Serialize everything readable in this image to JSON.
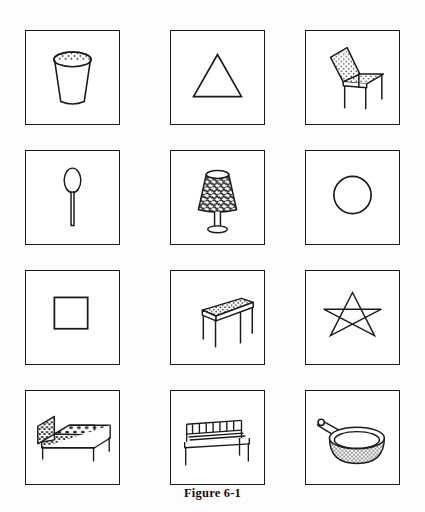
{
  "figure": {
    "caption": "Figure 6-1",
    "columns": 3,
    "rows": 4
  },
  "grid": {
    "cells": [
      {
        "index": 1,
        "row": 1,
        "column": 1,
        "name": "cup",
        "label": "cup",
        "category": "object",
        "icon": "cup-drawing"
      },
      {
        "index": 2,
        "row": 1,
        "column": 2,
        "name": "triangle",
        "label": "triangle",
        "category": "shape",
        "icon": "triangle-shape"
      },
      {
        "index": 3,
        "row": 1,
        "column": 3,
        "name": "chair",
        "label": "chair",
        "category": "object",
        "icon": "chair-drawing"
      },
      {
        "index": 4,
        "row": 2,
        "column": 1,
        "name": "spoon",
        "label": "spoon",
        "category": "object",
        "icon": "spoon-drawing"
      },
      {
        "index": 5,
        "row": 2,
        "column": 2,
        "name": "lamp",
        "label": "lamp",
        "category": "object",
        "icon": "lamp-drawing"
      },
      {
        "index": 6,
        "row": 2,
        "column": 3,
        "name": "circle",
        "label": "circle",
        "category": "shape",
        "icon": "circle-shape"
      },
      {
        "index": 7,
        "row": 3,
        "column": 1,
        "name": "square",
        "label": "square",
        "category": "shape",
        "icon": "square-shape"
      },
      {
        "index": 8,
        "row": 3,
        "column": 2,
        "name": "table",
        "label": "table",
        "category": "object",
        "icon": "table-drawing"
      },
      {
        "index": 9,
        "row": 3,
        "column": 3,
        "name": "star",
        "label": "star",
        "category": "shape",
        "icon": "star-shape"
      },
      {
        "index": 10,
        "row": 4,
        "column": 1,
        "name": "bed",
        "label": "bed",
        "category": "object",
        "icon": "bed-drawing"
      },
      {
        "index": 11,
        "row": 4,
        "column": 2,
        "name": "bench",
        "label": "bench",
        "category": "object",
        "icon": "bench-drawing"
      },
      {
        "index": 12,
        "row": 4,
        "column": 3,
        "name": "pan",
        "label": "frying pan",
        "category": "object",
        "icon": "frying-pan-drawing"
      }
    ]
  },
  "colors": {
    "ink": "#1a1a1a",
    "paper": "#ffffff",
    "page_background": "#fdfdfd"
  }
}
